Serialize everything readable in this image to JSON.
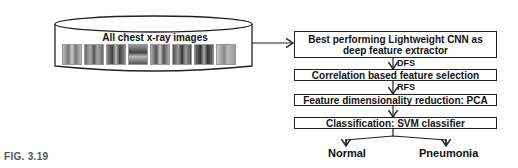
{
  "database": {
    "label": "All chest x-ray images",
    "thumbnail_count": 8
  },
  "steps": [
    {
      "label": "Best performing Lightweight CNN as deep feature extractor",
      "line1": "Best performing Lightweight CNN as",
      "line2": "deep feature extractor"
    },
    {
      "label": "Correlation based feature selection"
    },
    {
      "label": "Feature dimensionality reduction: PCA"
    },
    {
      "label": "Classification: SVM classifier"
    }
  ],
  "edge_labels": {
    "dfs": "DFS",
    "rfs": "RFS"
  },
  "outputs": [
    "Normal",
    "Pneumonia"
  ],
  "caption": "FIG. 3.19"
}
